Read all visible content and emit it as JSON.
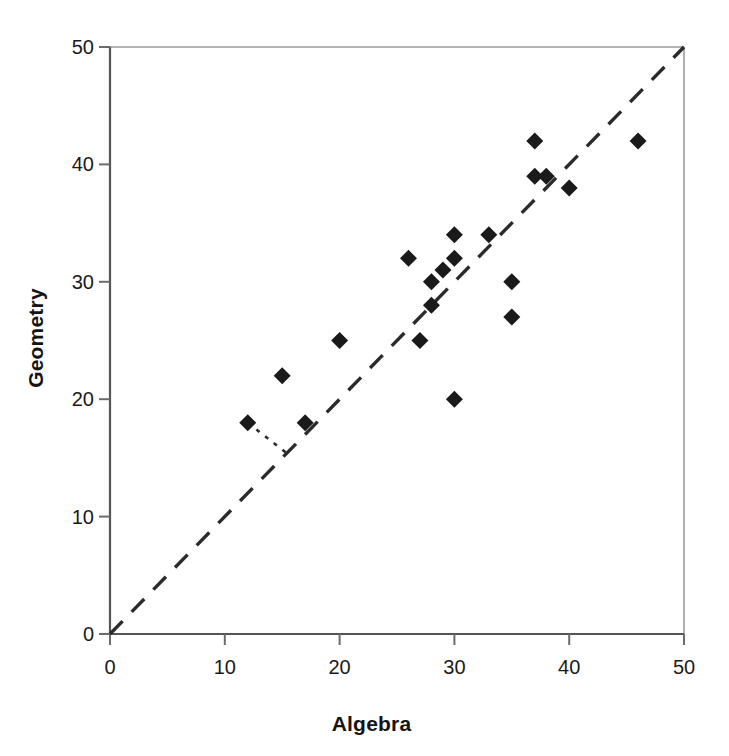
{
  "chart_data": {
    "type": "scatter",
    "title": "",
    "xlabel": "Algebra",
    "ylabel": "Geometry",
    "xlim": [
      0,
      50
    ],
    "ylim": [
      0,
      50
    ],
    "xticks": [
      0,
      10,
      20,
      30,
      40,
      50
    ],
    "yticks": [
      0,
      10,
      20,
      30,
      40,
      50
    ],
    "grid": false,
    "legend": "none",
    "marker": "filled-diamond",
    "marker_color": "#1a1a1a",
    "points": [
      {
        "x": 12,
        "y": 18
      },
      {
        "x": 15,
        "y": 22
      },
      {
        "x": 17,
        "y": 18
      },
      {
        "x": 20,
        "y": 25
      },
      {
        "x": 26,
        "y": 32
      },
      {
        "x": 27,
        "y": 25
      },
      {
        "x": 28,
        "y": 28
      },
      {
        "x": 28,
        "y": 30
      },
      {
        "x": 29,
        "y": 31
      },
      {
        "x": 30,
        "y": 20
      },
      {
        "x": 30,
        "y": 32
      },
      {
        "x": 30,
        "y": 34
      },
      {
        "x": 33,
        "y": 34
      },
      {
        "x": 35,
        "y": 27
      },
      {
        "x": 35,
        "y": 30
      },
      {
        "x": 37,
        "y": 39
      },
      {
        "x": 37,
        "y": 42
      },
      {
        "x": 38,
        "y": 39
      },
      {
        "x": 40,
        "y": 38
      },
      {
        "x": 46,
        "y": 42
      }
    ],
    "reference_line": {
      "name": "y = x identity line",
      "style": "dashed",
      "from": {
        "x": 0,
        "y": 0
      },
      "to": {
        "x": 50,
        "y": 50
      },
      "color": "#2b2b2b"
    },
    "annotation_line": {
      "name": "residual-connector",
      "style": "dotted",
      "from": {
        "x": 12,
        "y": 18
      },
      "to": {
        "x": 15.4,
        "y": 15.4
      },
      "color": "#2b2b2b"
    }
  },
  "axes": {
    "x_tick_labels": [
      "0",
      "10",
      "20",
      "30",
      "40",
      "50"
    ],
    "y_tick_labels": [
      "0",
      "10",
      "20",
      "30",
      "40",
      "50"
    ],
    "x_axis_title": "Algebra",
    "y_axis_title": "Geometry"
  },
  "colors": {
    "marker": "#1a1a1a",
    "axis": "#6b6b6b",
    "frame": "#8a8a8a",
    "reference_line": "#2b2b2b",
    "background": "#ffffff"
  }
}
